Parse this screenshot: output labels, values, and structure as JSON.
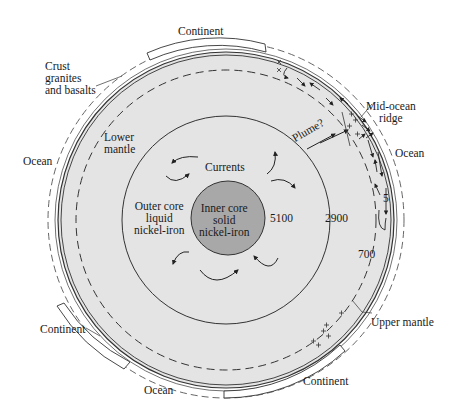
{
  "labels": {
    "continent_top": "Continent",
    "crust": [
      "Crust",
      "granites",
      "and basalts"
    ],
    "mid_ocean_ridge": [
      "Mid-ocean",
      "ridge"
    ],
    "ocean_right": "Ocean",
    "ocean_left": "Ocean",
    "lower_mantle": [
      "Lower",
      "mantle"
    ],
    "currents": "Currents",
    "plume": "Plume?",
    "outer_core": [
      "Outer core",
      "liquid",
      "nickel-iron"
    ],
    "inner_core": [
      "Inner core",
      "solid",
      "nickel-iron"
    ],
    "continent_left": "Continent",
    "upper_mantle": "Upper mantle",
    "ocean_bottom": "Ocean",
    "continent_bottom": "Continent"
  },
  "depths_km": {
    "inner_core_boundary": "5100",
    "core_mantle_boundary": "2900",
    "upper_lower_mantle_boundary": "700",
    "crust_thickness": "5"
  },
  "colors": {
    "mantle_fill": "#e4e4e4",
    "inner_core_fill": "#a8a8a8",
    "line": "#333333",
    "background": "#ffffff"
  }
}
